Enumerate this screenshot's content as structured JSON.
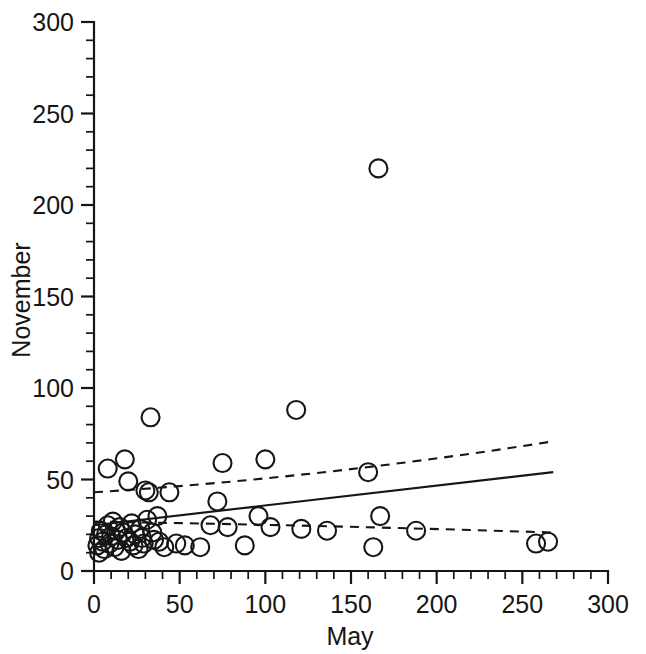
{
  "chart_data": {
    "type": "scatter",
    "title": "",
    "xlabel": "May",
    "ylabel": "November",
    "xlim": [
      0,
      300
    ],
    "ylim": [
      0,
      300
    ],
    "grid": false,
    "legend": null,
    "x_major_ticks": [
      0,
      50,
      100,
      150,
      200,
      250,
      300
    ],
    "y_major_ticks": [
      0,
      50,
      100,
      150,
      200,
      250,
      300
    ],
    "x_tick_labels": [
      "0",
      "50",
      "100",
      "150",
      "200",
      "250",
      "300"
    ],
    "y_tick_labels": [
      "0",
      "50",
      "100",
      "150",
      "200",
      "250",
      "300"
    ],
    "x_minor_tick_interval": 10,
    "y_minor_tick_interval": 10,
    "marker": "open-circle",
    "marker_radius_px": 9,
    "points": [
      [
        2,
        14
      ],
      [
        3,
        18
      ],
      [
        3,
        10
      ],
      [
        4,
        22
      ],
      [
        5,
        16
      ],
      [
        6,
        12
      ],
      [
        7,
        20
      ],
      [
        8,
        25
      ],
      [
        8,
        56
      ],
      [
        9,
        15
      ],
      [
        10,
        19
      ],
      [
        11,
        27
      ],
      [
        12,
        13
      ],
      [
        13,
        22
      ],
      [
        14,
        17
      ],
      [
        15,
        24
      ],
      [
        16,
        11
      ],
      [
        17,
        21
      ],
      [
        18,
        61
      ],
      [
        19,
        18
      ],
      [
        20,
        49
      ],
      [
        21,
        16
      ],
      [
        22,
        26
      ],
      [
        23,
        14
      ],
      [
        24,
        20
      ],
      [
        26,
        12
      ],
      [
        27,
        23
      ],
      [
        28,
        18
      ],
      [
        29,
        15
      ],
      [
        30,
        44
      ],
      [
        31,
        28
      ],
      [
        32,
        43
      ],
      [
        33,
        84
      ],
      [
        34,
        21
      ],
      [
        35,
        17
      ],
      [
        37,
        30
      ],
      [
        38,
        16
      ],
      [
        41,
        13
      ],
      [
        44,
        43
      ],
      [
        48,
        15
      ],
      [
        53,
        14
      ],
      [
        62,
        13
      ],
      [
        68,
        25
      ],
      [
        72,
        38
      ],
      [
        75,
        59
      ],
      [
        78,
        24
      ],
      [
        88,
        14
      ],
      [
        96,
        30
      ],
      [
        100,
        61
      ],
      [
        103,
        24
      ],
      [
        118,
        88
      ],
      [
        121,
        23
      ],
      [
        136,
        22
      ],
      [
        160,
        54
      ],
      [
        163,
        13
      ],
      [
        166,
        220
      ],
      [
        167,
        30
      ],
      [
        188,
        22
      ],
      [
        258,
        15
      ],
      [
        265,
        16
      ]
    ],
    "regression_line": {
      "style": "solid",
      "x_start": 0,
      "y_start": 25,
      "x_end": 268,
      "y_end": 54
    },
    "confidence_bands": [
      {
        "name": "upper-band",
        "style": "dashed",
        "x_start": 0,
        "y_start": 43,
        "x_mid": 134,
        "y_mid": 51,
        "x_end": 269,
        "y_end": 71
      },
      {
        "name": "lower-band",
        "style": "dashed",
        "x_start": 0,
        "y_start": 27,
        "x_mid": 134,
        "y_mid": 25,
        "x_end": 269,
        "y_end": 21
      }
    ]
  }
}
